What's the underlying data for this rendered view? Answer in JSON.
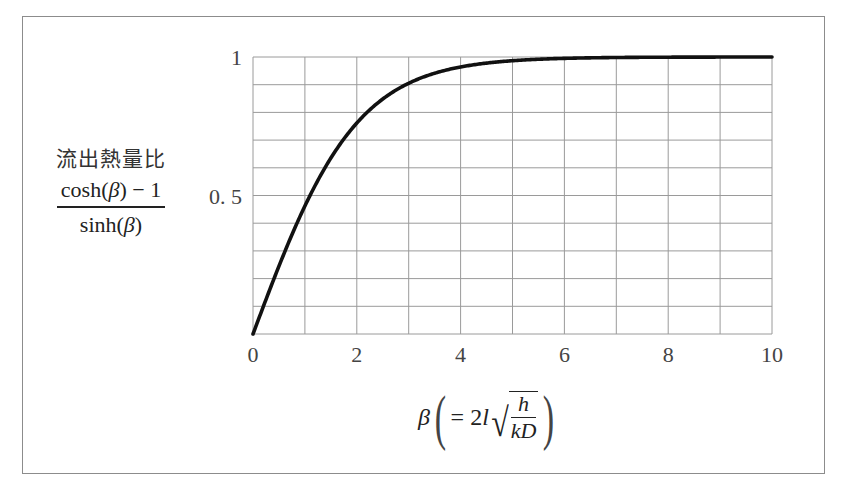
{
  "chart_data": {
    "type": "line",
    "title": "",
    "ylabel": {
      "title": "流出熱量比",
      "numerator": "cosh(β) − 1",
      "numerator_parts": [
        "cosh(",
        "β",
        ") − 1"
      ],
      "denominator": "sinh(β)",
      "denominator_parts": [
        "sinh(",
        "β",
        ")"
      ]
    },
    "xlabel": {
      "symbol": "β",
      "lparen": "(",
      "rparen": ")",
      "equals": "= 2",
      "l": "l",
      "sqrt_num": "h",
      "sqrt_den": "kD",
      "full": "β (= 2l√(h/kD))"
    },
    "xlim": [
      0,
      10
    ],
    "ylim": [
      0,
      1
    ],
    "x_ticks": [
      {
        "value": 0,
        "label": "0"
      },
      {
        "value": 2,
        "label": "2"
      },
      {
        "value": 4,
        "label": "4"
      },
      {
        "value": 6,
        "label": "6"
      },
      {
        "value": 8,
        "label": "8"
      },
      {
        "value": 10,
        "label": "10"
      }
    ],
    "y_ticks": [
      {
        "value": 0.5,
        "label": "0. 5"
      },
      {
        "value": 1,
        "label": "1"
      }
    ],
    "grid": {
      "x_step": 1,
      "y_step": 0.1,
      "on": true
    },
    "legend": null,
    "series": [
      {
        "name": "(cosh(β)−1)/sinh(β)",
        "color": "#111111",
        "x": [
          0,
          0.5,
          1,
          1.5,
          2,
          2.5,
          3,
          3.5,
          4,
          4.5,
          5,
          5.5,
          6,
          7,
          8,
          9,
          10
        ],
        "y": [
          0,
          0.245,
          0.462,
          0.635,
          0.762,
          0.848,
          0.905,
          0.941,
          0.964,
          0.978,
          0.987,
          0.992,
          0.995,
          0.998,
          0.999,
          1.0,
          1.0
        ]
      }
    ]
  },
  "colors": {
    "grid": "#9a9a9a",
    "curve": "#111111",
    "frame": "#8c8c8c",
    "text": "#333333"
  }
}
